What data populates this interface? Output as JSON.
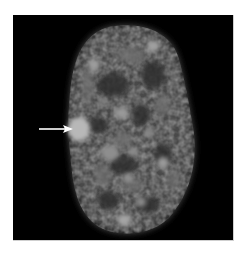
{
  "figure": {
    "colors": {
      "background": "#000000",
      "nucleus": "#5a5a5a",
      "bright_foci": "#a8a8a8",
      "arrow": "#ffffff",
      "page": "#ffffff"
    },
    "annotations": [
      {
        "type": "arrow",
        "points_to": "bright nuclear body",
        "icon": "arrow-right-icon"
      }
    ]
  }
}
